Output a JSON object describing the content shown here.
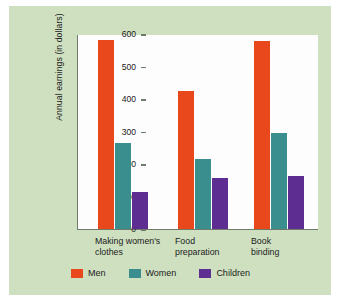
{
  "chart_data": {
    "type": "bar",
    "title": "",
    "xlabel": "",
    "ylabel": "Annual earnings (in dollars)",
    "ylim": [
      0,
      600
    ],
    "yticks": [
      "0",
      "100",
      "200",
      "300",
      "400",
      "500",
      "600"
    ],
    "grid": false,
    "legend_position": "bottom",
    "categories": [
      "Making women's\nclothes",
      "Food\npreparation",
      "Book\nbinding"
    ],
    "series": [
      {
        "name": "Men",
        "color": "#e8481c",
        "values": [
          583,
          425,
          578
        ]
      },
      {
        "name": "Women",
        "color": "#3a8e8e",
        "values": [
          265,
          215,
          295
        ]
      },
      {
        "name": "Children",
        "color": "#5e2d91",
        "values": [
          115,
          158,
          162
        ]
      }
    ]
  },
  "figure": {
    "background_color": "#cfe0c0",
    "plot_background_color": "#fdfdfd",
    "axis_color": "#6f7b6a"
  }
}
